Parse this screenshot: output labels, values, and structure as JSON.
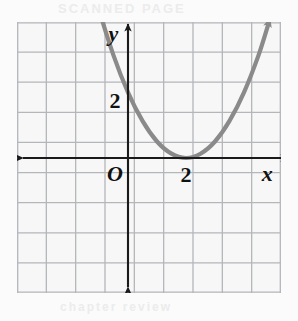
{
  "figure": {
    "kind": "coordinate-grid-graph",
    "background_color": "#fbfbfb",
    "grid": {
      "line_color": "#b5b6ba",
      "cell_size_px": 28,
      "columns": 9,
      "rows": 9,
      "left_px": 17,
      "top_px": 22,
      "width_px": 264,
      "height_px": 271
    },
    "axes": {
      "color": "#1a1a1a",
      "origin_label": "O",
      "x_axis_label": "x",
      "y_axis_label": "y",
      "x_tick_label": "2",
      "y_tick_label": "2",
      "origin_px": {
        "x": 111,
        "y": 136
      }
    },
    "curve": {
      "color": "#8a8a8a",
      "stroke_width": 4.2,
      "arrow_both_ends": true
    },
    "ghost_text": {
      "top": "SCANNED PAGE",
      "mid": "practice problems",
      "mid2": "graph the function",
      "bottom": "chapter review"
    }
  },
  "chart_data": {
    "type": "line",
    "title": "",
    "subtitle": "",
    "xlabel": "x",
    "ylabel": "y",
    "xlim": [
      -4,
      5
    ],
    "ylim": [
      -4,
      5
    ],
    "xticks": [
      2
    ],
    "yticks": [
      2
    ],
    "xtick_labels": [
      "2"
    ],
    "ytick_labels": [
      "2"
    ],
    "grid": true,
    "legend": null,
    "annotations": [
      {
        "text": "O",
        "x": -0.45,
        "y": -0.55
      },
      {
        "text": "2",
        "x": 2.0,
        "y": -0.6
      },
      {
        "text": "2",
        "x": -0.45,
        "y": 2.0
      },
      {
        "text": "x",
        "x": 4.8,
        "y": -0.55
      },
      {
        "text": "y",
        "x": -0.5,
        "y": 4.35
      }
    ],
    "series": [
      {
        "name": "parabola",
        "equation": "y = 0.58(x - 2)^2",
        "vertex": [
          2,
          0
        ],
        "opens": "up",
        "x": [
          -1.35,
          -1.0,
          -0.5,
          0.0,
          0.5,
          1.0,
          1.5,
          2.0,
          2.5,
          3.0,
          3.5,
          4.0,
          4.5,
          4.9
        ],
        "y": [
          6.5,
          5.2,
          3.6,
          2.3,
          1.3,
          0.58,
          0.15,
          0.0,
          0.15,
          0.58,
          1.3,
          2.3,
          3.6,
          4.9
        ]
      }
    ]
  }
}
